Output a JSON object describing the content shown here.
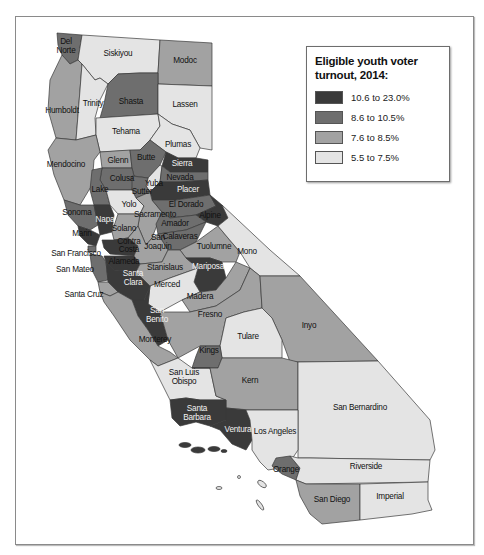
{
  "legend": {
    "title_line1": "Eligible youth voter",
    "title_line2": "turnout, 2014:",
    "items": [
      {
        "label": "10.6 to 23.0%",
        "color": "#3a3a3a"
      },
      {
        "label": "8.6 to 10.5%",
        "color": "#6e6e6e"
      },
      {
        "label": "7.6 to 8.5%",
        "color": "#a2a2a2"
      },
      {
        "label": "5.5 to 7.5%",
        "color": "#e4e4e4"
      }
    ]
  },
  "colors": {
    "c1": "#3a3a3a",
    "c2": "#6e6e6e",
    "c3": "#a2a2a2",
    "c4": "#e4e4e4"
  },
  "counties": {
    "del_norte": "Del",
    "del_norte2": "Norte",
    "siskiyou": "Siskiyou",
    "modoc": "Modoc",
    "humboldt": "Humboldt",
    "trinity": "Trinity",
    "shasta": "Shasta",
    "lassen": "Lassen",
    "tehama": "Tehama",
    "plumas": "Plumas",
    "mendocino": "Mendocino",
    "glenn": "Glenn",
    "butte": "Butte",
    "sierra": "Sierra",
    "colusa": "Colusa",
    "nevada": "Nevada",
    "yuba": "Yuba",
    "sutter": "Sutter",
    "lake": "Lake",
    "placer": "Placer",
    "yolo": "Yolo",
    "el_dorado": "El Dorado",
    "sonoma": "Sonoma",
    "napa": "Napa",
    "sacramento": "Sacramento",
    "alpine": "Alpine",
    "amador": "Amador",
    "marin": "Marin",
    "solano": "Solano",
    "calaveras": "Calaveras",
    "contra_costa": "Contra",
    "contra_costa2": "Costa",
    "san_joaquin": "San",
    "san_joaquin2": "Joaquin",
    "tuolumne": "Tuolumne",
    "mono": "Mono",
    "san_francisco": "San Francisco",
    "alameda": "Alameda",
    "san_mateo": "San Mateo",
    "stanislaus": "Stanislaus",
    "mariposa": "Mariposa",
    "santa_clara": "Santa",
    "santa_clara2": "Clara",
    "santa_cruz": "Santa Cruz",
    "merced": "Merced",
    "madera": "Madera",
    "san_benito": "San",
    "san_benito2": "Benito",
    "fresno": "Fresno",
    "inyo": "Inyo",
    "monterey": "Monterey",
    "tulare": "Tulare",
    "kings": "Kings",
    "san_luis_obispo": "San Luis",
    "san_luis_obispo2": "Obispo",
    "kern": "Kern",
    "san_bernardino": "San Bernardino",
    "santa_barbara": "Santa",
    "santa_barbara2": "Barbara",
    "ventura": "Ventura",
    "los_angeles": "Los Angeles",
    "orange": "Orange",
    "riverside": "Riverside",
    "san_diego": "San Diego",
    "imperial": "Imperial"
  }
}
